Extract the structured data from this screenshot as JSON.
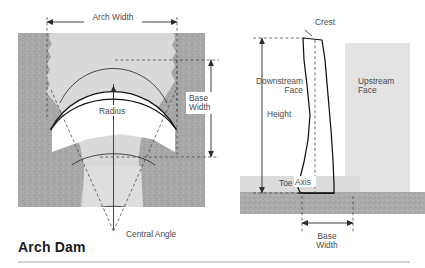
{
  "figure": {
    "title": "Arch Dam",
    "plan_view": {
      "name": "plan-view",
      "labels": {
        "arch_width": "Arch Width",
        "base_width": "Base\nWidth",
        "base_width_line1": "Base",
        "base_width_line2": "Width",
        "radius": "Radius",
        "central_angle": "Central Angle"
      }
    },
    "section_view": {
      "name": "cross-section-view",
      "labels": {
        "crest": "Crest",
        "downstream_face_line1": "Downstream",
        "downstream_face_line2": "Face",
        "upstream_face_line1": "Upstream",
        "upstream_face_line2": "Face",
        "height": "Height",
        "axis": "Axis",
        "toe": "Toe",
        "base_width_line1": "Base",
        "base_width_line2": "Width"
      }
    },
    "colors": {
      "rock_dark": "#a6a6a6",
      "rock_mid": "#bcbcbc",
      "valley_light": "#d9d9d9",
      "water_light": "#e3e3e3",
      "ground_dark": "#a9a9a9",
      "dam_fill": "#ffffff",
      "line": "#111111",
      "text": "#4a4a4a",
      "title": "#1c1c1c",
      "rule": "#9a9a9a",
      "background": "#ffffff"
    }
  }
}
